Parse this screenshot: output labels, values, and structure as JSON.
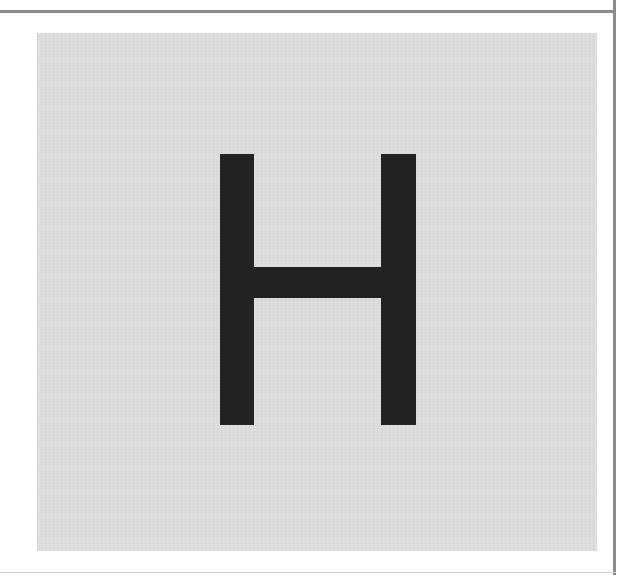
{
  "card": {
    "letter": "H",
    "background_color": "#dcdcdc",
    "letter_color": "#222222"
  },
  "frame": {
    "border_color": "#8a8a8a"
  }
}
